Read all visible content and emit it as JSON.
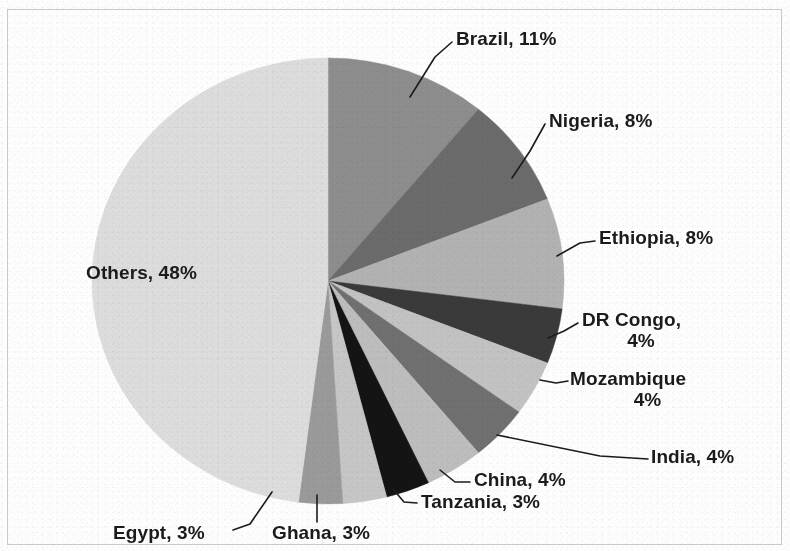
{
  "chart_data": {
    "type": "pie",
    "title": "",
    "subtitle": "",
    "xlabel": "",
    "ylabel": "",
    "units": "percent",
    "legend": "none",
    "labels_position": "outside-with-leader-lines",
    "start_angle_deg": 0,
    "direction": "clockwise",
    "categories": [
      "Brazil",
      "Nigeria",
      "Ethiopia",
      "DR Congo",
      "Mozambique",
      "India",
      "China",
      "Tanzania",
      "Ghana",
      "Egypt",
      "Others"
    ],
    "values": [
      11,
      8,
      8,
      4,
      4,
      4,
      4,
      3,
      3,
      3,
      48
    ],
    "value_suffix": "%",
    "colors": [
      "#8d8d8d",
      "#6b6b6b",
      "#b2b2b2",
      "#3a3a3a",
      "#c2c2c2",
      "#707070",
      "#bdbdbd",
      "#141414",
      "#c6c6c6",
      "#9a9a9a",
      "#dcdcdc"
    ],
    "slices": [
      {
        "name": "Brazil",
        "value": 11,
        "label": "Brazil, 11%",
        "color": "#8d8d8d"
      },
      {
        "name": "Nigeria",
        "value": 8,
        "label": "Nigeria, 8%",
        "color": "#6b6b6b"
      },
      {
        "name": "Ethiopia",
        "value": 8,
        "label": "Ethiopia, 8%",
        "color": "#b2b2b2"
      },
      {
        "name": "DR Congo",
        "value": 4,
        "label": "DR Congo, 4%",
        "color": "#3a3a3a"
      },
      {
        "name": "Mozambique",
        "value": 4,
        "label": "Mozambique 4%",
        "color": "#c2c2c2"
      },
      {
        "name": "India",
        "value": 4,
        "label": "India, 4%",
        "color": "#707070"
      },
      {
        "name": "China",
        "value": 4,
        "label": "China, 4%",
        "color": "#bdbdbd"
      },
      {
        "name": "Tanzania",
        "value": 3,
        "label": "Tanzania, 3%",
        "color": "#141414"
      },
      {
        "name": "Ghana",
        "value": 3,
        "label": "Ghana, 3%",
        "color": "#c6c6c6"
      },
      {
        "name": "Egypt",
        "value": 3,
        "label": "Egypt, 3%",
        "color": "#9a9a9a"
      },
      {
        "name": "Others",
        "value": 48,
        "label": "Others, 48%",
        "color": "#dcdcdc"
      }
    ]
  },
  "labels": {
    "brazil": "Brazil, 11%",
    "nigeria": "Nigeria, 8%",
    "ethiopia": "Ethiopia, 8%",
    "dr_congo_name": "DR Congo,",
    "dr_congo_pct": "4%",
    "mozambique_name": "Mozambique",
    "mozambique_pct": "4%",
    "india": "India, 4%",
    "china": "China, 4%",
    "tanzania": "Tanzania, 3%",
    "ghana": "Ghana, 3%",
    "egypt": "Egypt, 3%",
    "others": "Others, 48%"
  }
}
